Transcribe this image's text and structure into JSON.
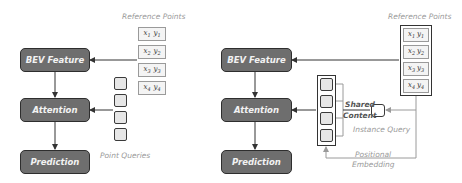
{
  "left_panel": {
    "blocks": {
      "bev_feature": "BEV Feature",
      "attention": "Attention",
      "prediction": "Prediction"
    },
    "reference_points_label": "Reference Points",
    "reference_points": [
      {
        "x": "x",
        "xi": "1",
        "y": "y",
        "yi": "1"
      },
      {
        "x": "x",
        "xi": "2",
        "y": "y",
        "yi": "2"
      },
      {
        "x": "x",
        "xi": "3",
        "y": "y",
        "yi": "3"
      },
      {
        "x": "x",
        "xi": "4",
        "y": "y",
        "yi": "4"
      }
    ],
    "point_queries_label": "Point Queries",
    "point_query_count": 4
  },
  "right_panel": {
    "blocks": {
      "bev_feature": "BEV Feature",
      "attention": "Attention",
      "prediction": "Prediction"
    },
    "reference_points_label": "Reference Points",
    "reference_points": [
      {
        "x": "x",
        "xi": "1",
        "y": "y",
        "yi": "1"
      },
      {
        "x": "x",
        "xi": "2",
        "y": "y",
        "yi": "2"
      },
      {
        "x": "x",
        "xi": "3",
        "y": "y",
        "yi": "3"
      },
      {
        "x": "x",
        "xi": "4",
        "y": "y",
        "yi": "4"
      }
    ],
    "shared_label": "Shared",
    "content_label": "Content",
    "instance_query_label": "Instance Query",
    "positional_label": "Positional",
    "embedding_label": "Embedding"
  },
  "colors": {
    "block_fill": "#6e6e6e",
    "block_border": "#2e2e2e",
    "block_text": "#f2f2f2",
    "label_gray": "#9a9a9a",
    "line_dark": "#333333",
    "line_light": "#9a9a9a"
  }
}
